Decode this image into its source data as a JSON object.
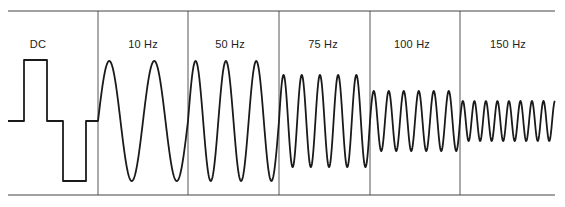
{
  "diagram": {
    "title": "",
    "stroke_color": "#1a1a1a",
    "grid_color": "#444444",
    "baseline_y": 121,
    "frame": {
      "x0": 8,
      "x1": 555,
      "top_y": 11,
      "bottom_y": 195
    },
    "dividers_x": [
      98,
      188,
      279,
      370,
      460
    ],
    "segments": [
      {
        "label": "DC",
        "label_x": 38,
        "type": "square",
        "x0": 8,
        "x1": 98,
        "high_y": 60,
        "low_y": 181,
        "steps_x": [
          24,
          47,
          63,
          86
        ]
      },
      {
        "label": "10 Hz",
        "label_x": 143,
        "type": "sine",
        "x0": 98,
        "x1": 188,
        "cycles": 2.0,
        "amplitude": 60
      },
      {
        "label": "50 Hz",
        "label_x": 230,
        "type": "sine",
        "x0": 188,
        "x1": 279,
        "cycles": 3.0,
        "amplitude": 60
      },
      {
        "label": "75 Hz",
        "label_x": 323,
        "type": "sine",
        "x0": 279,
        "x1": 370,
        "cycles": 5.0,
        "amplitude": 46
      },
      {
        "label": "100 Hz",
        "label_x": 412,
        "type": "sine",
        "x0": 370,
        "x1": 460,
        "cycles": 6.0,
        "amplitude": 30
      },
      {
        "label": "150 Hz",
        "label_x": 508,
        "type": "sine",
        "x0": 460,
        "x1": 555,
        "cycles": 8.25,
        "amplitude": 20
      }
    ]
  }
}
